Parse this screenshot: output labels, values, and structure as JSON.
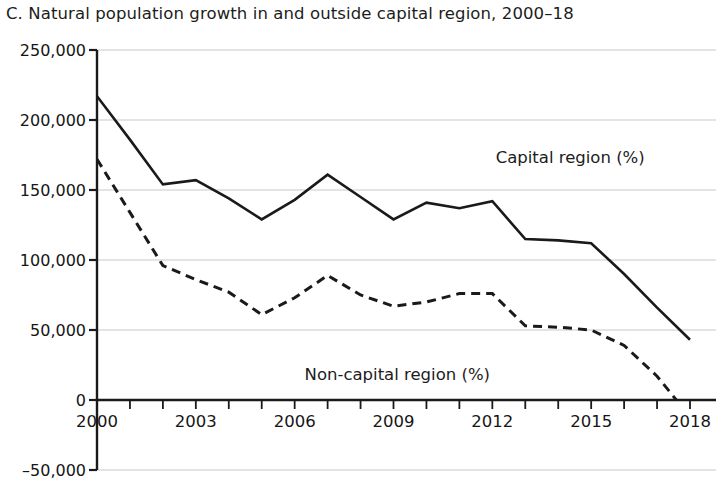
{
  "chart_data": {
    "type": "line",
    "title": "C. Natural population growth in and outside capital region, 2000–18",
    "xlabel": "",
    "ylabel": "",
    "xlim": [
      2000,
      2018
    ],
    "ylim": [
      -50000,
      250000
    ],
    "grid": true,
    "legend_position": "inline-annotation",
    "x": [
      2000,
      2001,
      2002,
      2003,
      2004,
      2005,
      2006,
      2007,
      2008,
      2009,
      2010,
      2011,
      2012,
      2013,
      2014,
      2015,
      2016,
      2017,
      2018
    ],
    "y_tick_labels": [
      "250,000",
      "200,000",
      "150,000",
      "100,000",
      "50,000",
      "0",
      "–50,000"
    ],
    "y_tick_values": [
      250000,
      200000,
      150000,
      100000,
      50000,
      0,
      -50000
    ],
    "x_tick_labels": [
      "2000",
      "2003",
      "2006",
      "2009",
      "2012",
      "2015",
      "2018"
    ],
    "x_tick_values": [
      2000,
      2003,
      2006,
      2009,
      2012,
      2015,
      2018
    ],
    "x_minor_ticks": [
      2001,
      2002,
      2004,
      2005,
      2007,
      2008,
      2010,
      2011,
      2013,
      2014,
      2016,
      2017
    ],
    "series": [
      {
        "name": "Capital region (%)",
        "style": "solid",
        "color": "#1a1a1a",
        "label_x": 2012.1,
        "label_y": 172000,
        "values": [
          217000,
          186000,
          154000,
          157000,
          144000,
          129000,
          143000,
          161000,
          145000,
          129000,
          141000,
          137000,
          142000,
          115000,
          114000,
          112000,
          90000,
          66000,
          43000
        ]
      },
      {
        "name": "Non-capital region (%)",
        "style": "dashed",
        "color": "#1a1a1a",
        "label_x": 2006.3,
        "label_y": 17000,
        "values": [
          172000,
          134000,
          96000,
          86000,
          77000,
          61000,
          73000,
          89000,
          75000,
          67000,
          70000,
          76000,
          76000,
          53000,
          52000,
          50000,
          39000,
          17000,
          -12000
        ]
      }
    ]
  }
}
